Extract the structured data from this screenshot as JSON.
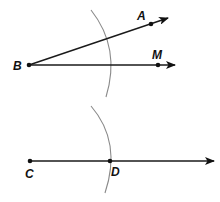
{
  "diagram": {
    "colors": {
      "line": "#1a1a1a",
      "arc": "#8a8a8a",
      "point": "#111111",
      "background": "#ffffff"
    },
    "points": {
      "A": {
        "label": "A",
        "x": 151,
        "y": 24
      },
      "B": {
        "label": "B",
        "x": 29,
        "y": 65
      },
      "M": {
        "label": "M",
        "x": 158,
        "y": 65
      },
      "C": {
        "label": "C",
        "x": 30,
        "y": 161
      },
      "D": {
        "label": "D",
        "x": 110,
        "y": 161
      }
    },
    "rays": [
      {
        "name": "ray-BA",
        "from": "B",
        "through": "A",
        "arrow": true
      },
      {
        "name": "ray-BM",
        "from": "B",
        "through": "M",
        "arrow": true
      },
      {
        "name": "ray-CD",
        "from": "C",
        "through": "D",
        "arrow": true
      }
    ],
    "arcs": [
      {
        "name": "arc-centered-B",
        "center": "B"
      },
      {
        "name": "arc-centered-C",
        "center": "C",
        "passes_through": "D"
      }
    ]
  }
}
